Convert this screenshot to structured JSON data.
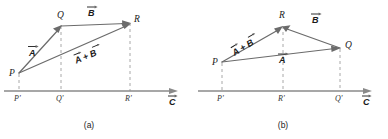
{
  "figure": {
    "type": "diagram",
    "background_color": "#ffffff",
    "vector_color": "#6b6b6b",
    "axis_color": "#8a8a8a",
    "projection_color": "#a8a8a8",
    "text_color": "#222222",
    "axis_label": "C",
    "captions": {
      "a": "(a)",
      "b": "(b)"
    }
  },
  "panels": [
    {
      "id": "a",
      "caption": "(a)",
      "points": [
        {
          "name": "P",
          "label": "P",
          "x": 19,
          "y": 73
        },
        {
          "name": "Q",
          "label": "Q",
          "x": 61,
          "y": 26
        },
        {
          "name": "R",
          "label": "R",
          "x": 130,
          "y": 23
        },
        {
          "name": "P'",
          "label": "P'",
          "x": 19,
          "y": 91
        },
        {
          "name": "Q'",
          "label": "Q'",
          "x": 61,
          "y": 91
        },
        {
          "name": "R'",
          "label": "R'",
          "x": 130,
          "y": 91
        }
      ],
      "vectors": [
        {
          "name": "A",
          "label": "A",
          "from": "P",
          "to": "Q",
          "label_x": 33,
          "label_y": 54
        },
        {
          "name": "B",
          "label": "B",
          "from": "Q",
          "to": "R",
          "label_x": 92,
          "label_y": 14
        },
        {
          "name": "A + B",
          "label": "A + B",
          "from": "P",
          "to": "R",
          "label_x": 84,
          "label_y": 56
        }
      ],
      "axis": {
        "x1": 4,
        "y1": 91,
        "x2": 176,
        "y2": 91,
        "label": "C",
        "label_x": 171,
        "label_y": 104
      },
      "projections": [
        {
          "from": "P",
          "to": "P'"
        },
        {
          "from": "Q",
          "to": "Q'"
        },
        {
          "from": "R",
          "to": "R'"
        }
      ]
    },
    {
      "id": "b",
      "caption": "(b)",
      "points": [
        {
          "name": "P",
          "label": "P",
          "x": 28,
          "y": 62
        },
        {
          "name": "R",
          "label": "R",
          "x": 89,
          "y": 26
        },
        {
          "name": "Q",
          "label": "Q",
          "x": 146,
          "y": 48
        },
        {
          "name": "P'",
          "label": "P'",
          "x": 28,
          "y": 91
        },
        {
          "name": "R'",
          "label": "R'",
          "x": 89,
          "y": 91
        },
        {
          "name": "Q'",
          "label": "Q'",
          "x": 146,
          "y": 91
        }
      ],
      "vectors": [
        {
          "name": "A",
          "label": "A",
          "from": "P",
          "to": "Q",
          "label_x": 86,
          "label_y": 61
        },
        {
          "name": "B",
          "label": "B",
          "from": "Q",
          "to": "R",
          "label_x": 120,
          "label_y": 21
        },
        {
          "name": "A + B",
          "label": "A + B",
          "from": "P",
          "to": "R",
          "label_x": 47,
          "label_y": 45
        }
      ],
      "axis": {
        "x1": 4,
        "y1": 91,
        "x2": 176,
        "y2": 91,
        "label": "C",
        "label_x": 171,
        "label_y": 104
      },
      "projections": [
        {
          "from": "P",
          "to": "P'"
        },
        {
          "from": "R",
          "to": "R'"
        },
        {
          "from": "Q",
          "to": "Q'"
        }
      ]
    }
  ]
}
